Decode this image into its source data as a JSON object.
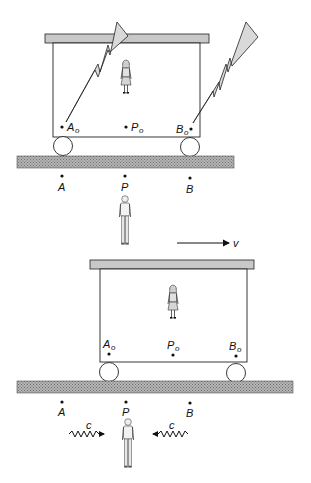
{
  "figure": {
    "colors": {
      "ink": "#111111",
      "roof": "#c8c8c8",
      "bolt": "#d9d9d9",
      "rail": "#9a9a9a",
      "background": "#ffffff"
    }
  },
  "top_scene": {
    "car_points": [
      {
        "name": "A",
        "sub": "o"
      },
      {
        "name": "P",
        "sub": "o"
      },
      {
        "name": "B",
        "sub": "o"
      }
    ],
    "ground_points": [
      "A",
      "P",
      "B"
    ],
    "lightning_bolts": [
      "left-bolt-at-A0",
      "right-bolt-at-B0"
    ],
    "observers": [
      "woman-on-car",
      "man-on-ground"
    ]
  },
  "velocity": {
    "label": "v",
    "direction": "right"
  },
  "bottom_scene": {
    "car_points": [
      {
        "name": "A",
        "sub": "o"
      },
      {
        "name": "P",
        "sub": "o"
      },
      {
        "name": "B",
        "sub": "o"
      }
    ],
    "ground_points": [
      "A",
      "P",
      "B"
    ],
    "light_signals": [
      {
        "label": "c",
        "direction": "right"
      },
      {
        "label": "c",
        "direction": "left"
      }
    ],
    "observers": [
      "woman-on-car",
      "man-on-ground"
    ]
  }
}
